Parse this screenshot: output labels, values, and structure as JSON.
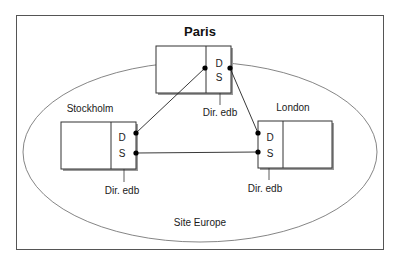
{
  "diagram": {
    "site_label": "Site Europe",
    "colors": {
      "line": "#222222",
      "frame": "#555555",
      "shadow": "#9a9a9a",
      "ellipse": "#555555",
      "dot": "#000000"
    },
    "nodes": [
      {
        "id": "paris",
        "name": "Paris",
        "ds_letters": [
          "D",
          "S"
        ],
        "dir_label": "Dir. edb"
      },
      {
        "id": "stockholm",
        "name": "Stockholm",
        "ds_letters": [
          "D",
          "S"
        ],
        "dir_label": "Dir. edb"
      },
      {
        "id": "london",
        "name": "London",
        "ds_letters": [
          "D",
          "S"
        ],
        "dir_label": "Dir. edb"
      }
    ],
    "edges": [
      {
        "from": "paris",
        "to": "stockholm"
      },
      {
        "from": "paris",
        "to": "london"
      },
      {
        "from": "stockholm",
        "to": "london"
      }
    ]
  }
}
